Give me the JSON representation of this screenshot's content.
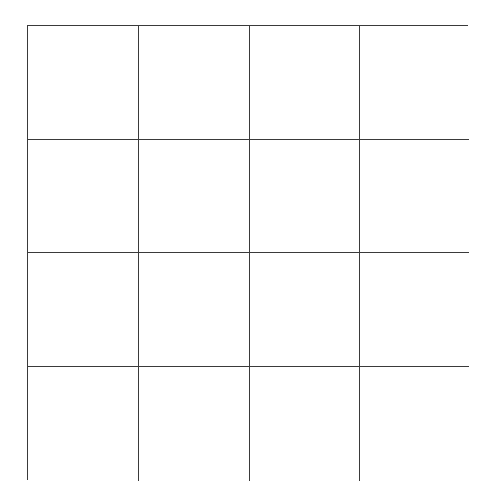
{
  "board": {
    "rows": 4,
    "cols": 4,
    "line_color": "#3a3a3a",
    "background_color": "#ffffff",
    "cells": [
      [
        "",
        "",
        "",
        ""
      ],
      [
        "",
        "",
        "",
        ""
      ],
      [
        "",
        "",
        "",
        ""
      ],
      [
        "",
        "",
        "",
        ""
      ]
    ]
  }
}
